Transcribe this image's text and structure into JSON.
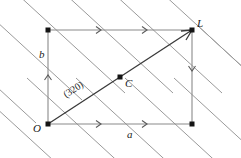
{
  "figure": {
    "background_color": "#ffffff",
    "labels": {
      "origin": "O",
      "lattice_point": "L",
      "center": "C",
      "axis_a": "a",
      "axis_b": "b",
      "plane_index": "(320)"
    },
    "colors": {
      "lattice_line": "#9a9a9a",
      "cell_edge": "#8a8a8a",
      "diagonal_vector": "#3a3a3a",
      "node_dot": "#141414",
      "text": "#1a1a1a"
    },
    "geometry": {
      "cell": {
        "origin_x": 48,
        "origin_y": 124,
        "top_left_x": 48,
        "top_left_y": 30,
        "top_right_x": 192,
        "top_right_y": 30,
        "bottom_right_x": 192,
        "bottom_right_y": 124
      },
      "center_point": {
        "x": 120,
        "y": 77
      },
      "lattice_line_slope": 0.92,
      "lattice_line_count": 8
    }
  }
}
